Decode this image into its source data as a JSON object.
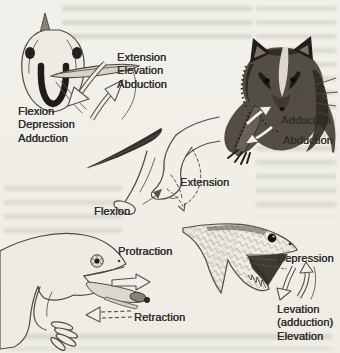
{
  "figure": {
    "colors": {
      "paper": "#f1efe9",
      "ink": "#2f2e2b",
      "line": "#4c4a45"
    },
    "panels": {
      "fish": {
        "animal": "fish-head-with-pectoral-fin",
        "label_up": "Extension\nElevation\nAbduction",
        "label_down": "Flexion\nDepression\nAdduction"
      },
      "opossum": {
        "animal": "opossum-with-forelimb",
        "label_adduction": "Adduction",
        "label_abduction": "Abduction"
      },
      "hindlimb": {
        "animal": "mammal-hindquarters",
        "label_extension": "Extension",
        "label_flexion": "Flexion"
      },
      "salamander": {
        "animal": "salamander-head-with-tongue",
        "label_protraction": "Protraction",
        "label_retraction": "Retraction"
      },
      "lizard": {
        "animal": "lizard-head-open-jaw",
        "label_depression": "Depression",
        "label_levation": "Levation\n(adduction)\nElevation"
      }
    }
  }
}
